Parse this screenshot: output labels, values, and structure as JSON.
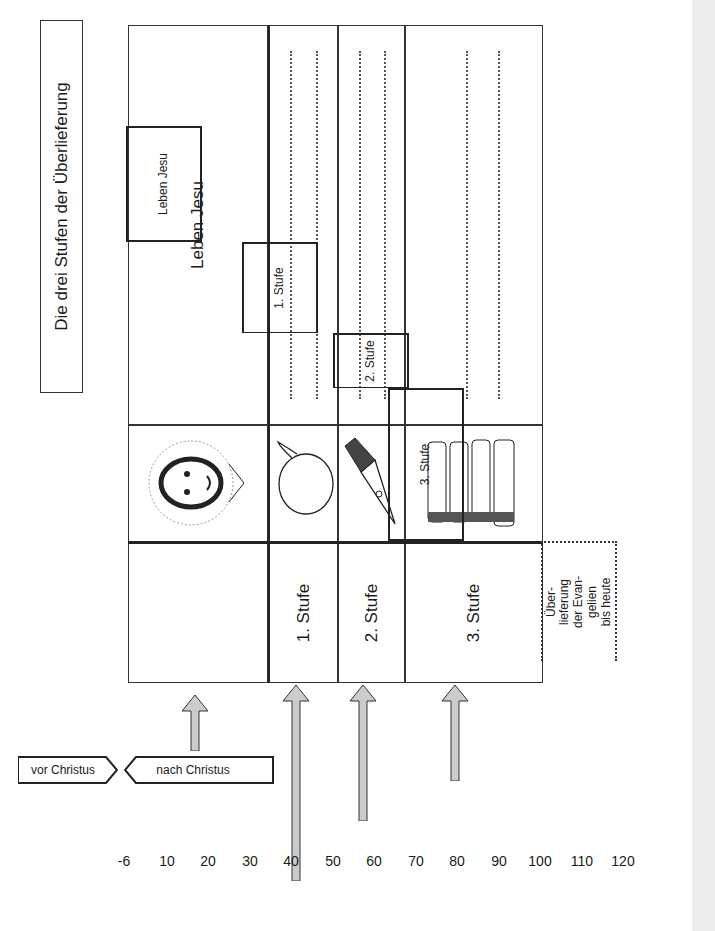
{
  "title": "Die drei Stufen der Überlieferung",
  "table": {
    "header_row": {
      "text": "Leben Jesu",
      "icon": "jesus-portrait-icon"
    },
    "rows": [
      {
        "label": "1. Stufe",
        "icon": "speech-bubble-icon",
        "answer_lines": 2
      },
      {
        "label": "2. Stufe",
        "icon": "fountain-pen-icon",
        "answer_lines": 2
      },
      {
        "label": "3. Stufe",
        "icon": "book-stack-icon",
        "answer_lines": 2
      }
    ]
  },
  "timeline": {
    "direction_labels": {
      "before": "vor Christus",
      "after": "nach Christus"
    },
    "segments": [
      {
        "label": "Leben Jesu",
        "from": -6,
        "to": 28
      },
      {
        "label": "1. Stufe",
        "from": 28,
        "to": 50
      },
      {
        "label": "2. Stufe",
        "from": 50,
        "to": 65
      },
      {
        "label": "3. Stufe",
        "from": 65,
        "to": 100
      }
    ],
    "continuation_label": [
      "Über-",
      "lieferung",
      "der Evan-",
      "gelien",
      "bis heute"
    ],
    "ticks": [
      "-6",
      "10",
      "20",
      "30",
      "40",
      "50",
      "60",
      "70",
      "80",
      "90",
      "100",
      "110",
      "120"
    ]
  }
}
